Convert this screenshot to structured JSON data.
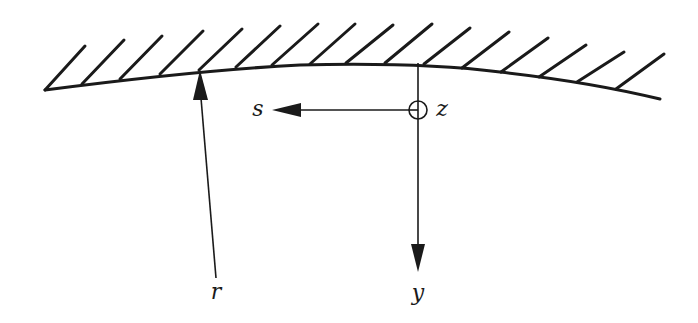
{
  "diagram": {
    "type": "wall-coordinate-system",
    "colors": {
      "ink": "#1a1a1a",
      "background": "#ffffff"
    },
    "wall": {
      "description": "curved boundary surface with hatching",
      "hatch_count": 16
    },
    "labels": {
      "s": "s",
      "z": "z",
      "r": "r",
      "y": "y"
    },
    "axes": [
      {
        "name": "s",
        "direction": "left",
        "description": "streamwise coordinate along wall"
      },
      {
        "name": "y",
        "direction": "down",
        "description": "wall-normal coordinate"
      },
      {
        "name": "z",
        "direction": "out-of-page",
        "symbol": "circle-with-dot",
        "description": "spanwise coordinate"
      },
      {
        "name": "r",
        "direction": "up",
        "description": "radius from axis to wall"
      }
    ]
  }
}
